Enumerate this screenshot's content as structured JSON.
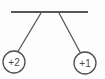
{
  "figure": {
    "kind": "physics-diagram",
    "background_color": "#fdfdfd",
    "support": {
      "name": "horizontal support bar",
      "color": "#575757",
      "thickness": 2,
      "x_start": 11,
      "x_end": 88,
      "y": 12
    },
    "strings": [
      {
        "name": "left string",
        "color": "#585858",
        "thickness": 1.3,
        "from_x": 41,
        "from_y": 13,
        "to_x": 17,
        "to_y": 53
      },
      {
        "name": "right string",
        "color": "#585858",
        "thickness": 1.3,
        "from_x": 59,
        "from_y": 13,
        "to_x": 81,
        "to_y": 54
      }
    ],
    "charges": [
      {
        "name": "left charge",
        "label": "+2",
        "cx": 14,
        "cy": 62,
        "r": 11,
        "stroke": "#4f4f4f",
        "fill": "#ffffff"
      },
      {
        "name": "right charge",
        "label": "+1",
        "cx": 85,
        "cy": 63,
        "r": 11,
        "stroke": "#4f4f4f",
        "fill": "#ffffff"
      }
    ]
  }
}
